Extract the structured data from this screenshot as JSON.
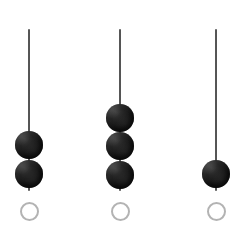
{
  "figure": {
    "title": "Bead Counter",
    "background_color": "#ffffff",
    "width": 249,
    "height": 229
  },
  "style": {
    "bead_color": "#151515",
    "rod_color": "#2b2b2b",
    "slot_stroke_color": "#b3b3b3",
    "slot_fill": "none",
    "rod_width_px": 2,
    "bead_diameter_px": 28,
    "slot_diameter_px": 19,
    "slot_stroke_px": 2
  },
  "chart_data": {
    "type": "bar",
    "title": "Bead Counter",
    "xlabel": "",
    "ylabel": "",
    "categories": [
      "1",
      "2",
      "3"
    ],
    "values": [
      2,
      3,
      1
    ],
    "ylim": [
      0,
      6
    ],
    "grid": false,
    "legend": null
  },
  "columns": [
    {
      "id": "column-1",
      "label": "1",
      "bead_count": 2,
      "rod": {
        "x": 29,
        "top": 29,
        "bottom": 191
      },
      "beads": [
        {
          "index": 1,
          "cx": 29,
          "cy": 145
        },
        {
          "index": 2,
          "cx": 29,
          "cy": 174
        }
      ],
      "slot": {
        "cx": 29,
        "cy": 211
      }
    },
    {
      "id": "column-2",
      "label": "2",
      "bead_count": 3,
      "rod": {
        "x": 120,
        "top": 29,
        "bottom": 191
      },
      "beads": [
        {
          "index": 1,
          "cx": 120,
          "cy": 118
        },
        {
          "index": 2,
          "cx": 120,
          "cy": 146
        },
        {
          "index": 3,
          "cx": 120,
          "cy": 175
        }
      ],
      "slot": {
        "cx": 120,
        "cy": 211
      }
    },
    {
      "id": "column-3",
      "label": "3",
      "bead_count": 1,
      "rod": {
        "x": 216,
        "top": 29,
        "bottom": 191
      },
      "beads": [
        {
          "index": 1,
          "cx": 216,
          "cy": 174
        }
      ],
      "slot": {
        "cx": 216,
        "cy": 211
      }
    }
  ]
}
